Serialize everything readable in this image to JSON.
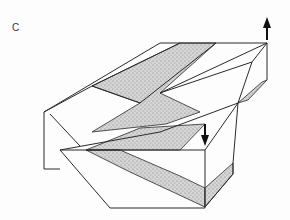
{
  "figure": {
    "panel_label": "C",
    "arrows": [
      {
        "name": "up-arrow",
        "direction": "up"
      },
      {
        "name": "down-arrow",
        "direction": "down"
      }
    ],
    "colors": {
      "line": "#2a2a2a",
      "stipple": "#bdbdbd",
      "background": "#fdfdfd"
    }
  }
}
